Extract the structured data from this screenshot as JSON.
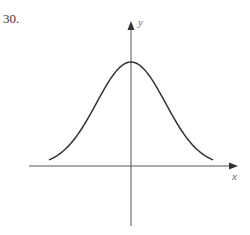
{
  "problem": {
    "number": "30."
  },
  "chart_data": {
    "type": "line",
    "title": "",
    "xlabel": "x",
    "ylabel": "y",
    "grid": false,
    "legend": null,
    "x": [
      -1.0,
      -0.8,
      -0.6,
      -0.4,
      -0.2,
      0.0,
      0.2,
      0.4,
      0.6,
      0.8,
      1.0
    ],
    "series": [
      {
        "name": "curve",
        "values": [
          0.05,
          0.2,
          0.45,
          0.72,
          0.93,
          1.0,
          0.93,
          0.72,
          0.45,
          0.2,
          0.05
        ]
      }
    ],
    "tick_labels": {
      "x": [],
      "y": []
    }
  },
  "colors": {
    "axis": "#555555",
    "curve": "#333333"
  }
}
